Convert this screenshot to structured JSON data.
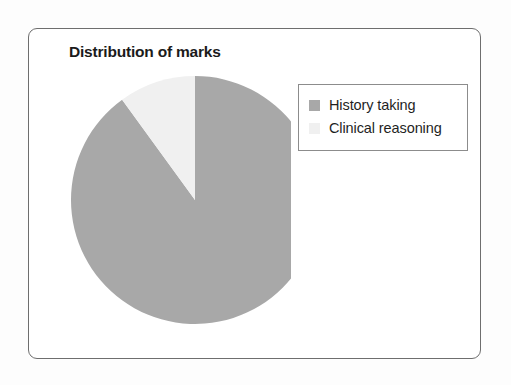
{
  "figure": {
    "title": "Distribution of marks",
    "background_color": "#ffffff",
    "border_color": "#6e6e6e"
  },
  "legend": {
    "position": "top-right",
    "border_color": "#8c8c8c",
    "entries": [
      {
        "label": "History taking",
        "color": "#a8a8a8"
      },
      {
        "label": "Clinical reasoning",
        "color": "#f0f0f0"
      }
    ]
  },
  "chart_data": {
    "type": "pie",
    "title": "Distribution of marks",
    "xlabel": "",
    "ylabel": "",
    "start_angle_deg": 0,
    "direction": "clockwise",
    "labels": [
      "History taking",
      "Clinical reasoning"
    ],
    "values": [
      90,
      10
    ],
    "percentages": [
      "90%",
      "10%"
    ],
    "colors": [
      "#a8a8a8",
      "#f0f0f0"
    ],
    "slices": [
      {
        "name": "History taking",
        "value": 90,
        "percent": 90,
        "color": "#a8a8a8",
        "start_deg": 0,
        "end_deg": 324
      },
      {
        "name": "Clinical reasoning",
        "value": 10,
        "percent": 10,
        "color": "#f0f0f0",
        "start_deg": 324,
        "end_deg": 360
      }
    ],
    "data_labels_shown": false,
    "grid": false,
    "legend_position": "top-right"
  }
}
